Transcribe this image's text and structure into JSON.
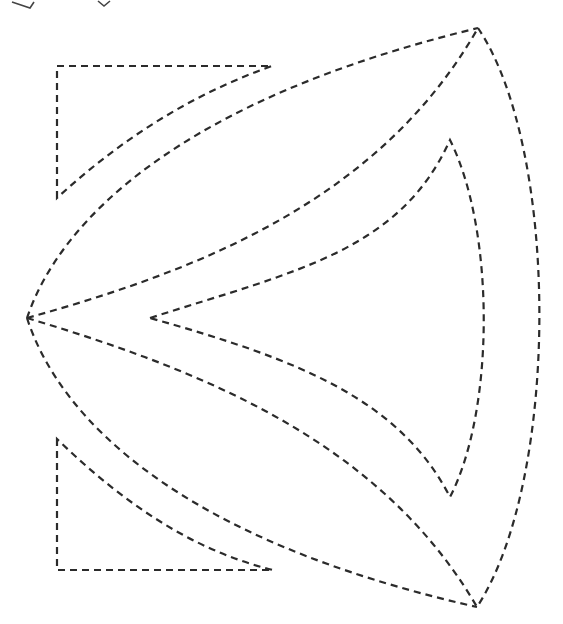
{
  "figure": {
    "type": "cutting-template",
    "line_style": "dashed",
    "line_color": "#2b2b2b",
    "background": "#ffffff"
  },
  "pieces": [
    {
      "id": "upper-lens-outer-arc",
      "label": "upper lens outer edge"
    },
    {
      "id": "upper-lens-inner-arc",
      "label": "upper lens inner edge"
    },
    {
      "id": "lower-lens-outer-arc",
      "label": "lower lens outer edge"
    },
    {
      "id": "lower-lens-inner-arc",
      "label": "lower lens inner edge"
    },
    {
      "id": "right-outer-arc",
      "label": "right outer edge"
    },
    {
      "id": "inner-curved-triangle",
      "label": "inner curved triangle"
    },
    {
      "id": "top-left-corner-triangle",
      "label": "top-left corner piece"
    },
    {
      "id": "bottom-left-corner-triangle",
      "label": "bottom-left corner piece"
    }
  ]
}
